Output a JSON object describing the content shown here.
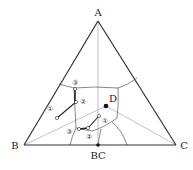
{
  "diagram": {
    "type": "ternary-phase-diagram",
    "vertices": {
      "A": {
        "label": "A",
        "x": 98,
        "y": 21
      },
      "B": {
        "label": "B",
        "x": 24,
        "y": 145
      },
      "C": {
        "label": "C",
        "x": 176,
        "y": 145
      }
    },
    "compounds": {
      "BC": {
        "label": "BC",
        "x": 98,
        "y": 145
      },
      "D": {
        "label": "D",
        "x": 106,
        "y": 106
      }
    },
    "path_markers": {
      "upper": [
        "①",
        "②",
        "③"
      ],
      "lower": [
        "①",
        "②",
        "③"
      ]
    },
    "colors": {
      "outline": "#333333",
      "boundary": "#555555",
      "joins": "#888888",
      "path": "#222222"
    }
  }
}
